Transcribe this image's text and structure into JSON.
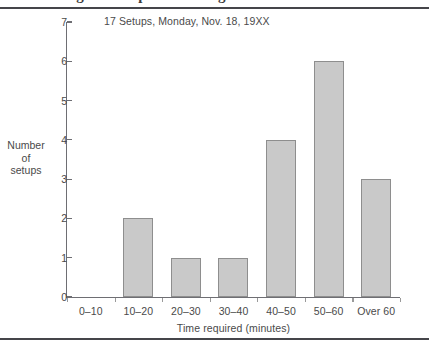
{
  "figure": {
    "clipped_heading_above_rule": "Figure setup time histogram",
    "y_axis_title_lines": [
      "Number",
      "of",
      "setups"
    ]
  },
  "chart_data": {
    "type": "bar",
    "title": "17 Setups, Monday, Nov. 18, 19XX",
    "xlabel": "Time required (minutes)",
    "ylabel": "Number of setups",
    "categories": [
      "0–10",
      "10–20",
      "20–30",
      "30–40",
      "40–50",
      "50–60",
      "Over 60"
    ],
    "values": [
      0,
      2,
      1,
      1,
      4,
      6,
      3
    ],
    "ylim": [
      0,
      7
    ],
    "yticks": [
      "0",
      "1",
      "2",
      "3",
      "4",
      "5",
      "6",
      "7"
    ],
    "ytick_values": [
      0,
      1,
      2,
      3,
      4,
      5,
      6,
      7
    ],
    "grid": false,
    "legend": "none",
    "total_setups": 17,
    "bar_color": "#c9c9c9",
    "bar_border_color": "#8e8e8e",
    "axis_color": "#6e6e73",
    "text_color": "#4a4a4a"
  }
}
